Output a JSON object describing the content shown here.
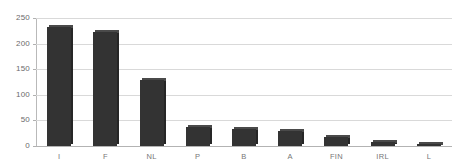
{
  "chart_data": {
    "type": "bar",
    "title": "",
    "subtitle": "",
    "xlabel": "",
    "ylabel": "",
    "categories": [
      "I",
      "F",
      "NL",
      "P",
      "B",
      "A",
      "FIN",
      "IRL",
      "L"
    ],
    "values": [
      232,
      222,
      129,
      37,
      33,
      29,
      17,
      7,
      3
    ],
    "series": [
      {
        "name": "",
        "values": [
          232,
          222,
          129,
          37,
          33,
          29,
          17,
          7,
          3
        ]
      }
    ],
    "ylim": [
      0,
      250
    ],
    "yticks": [
      0,
      50,
      100,
      150,
      200,
      250
    ],
    "ytick_labels": [
      "0",
      "50",
      "100",
      "150",
      "200",
      "250"
    ],
    "grid": true,
    "grid_axis": "y",
    "legend": false,
    "legend_position": "none",
    "bar_color": "#333333",
    "bar_top_color": "#4a4a4a",
    "bar_side_color": "#262626",
    "gridline_color": "#d9d9d9",
    "axis_color": "#b9b9b9",
    "background_color": "#ffffff",
    "tick_label_color": "#6b6b6b",
    "annotations": []
  }
}
